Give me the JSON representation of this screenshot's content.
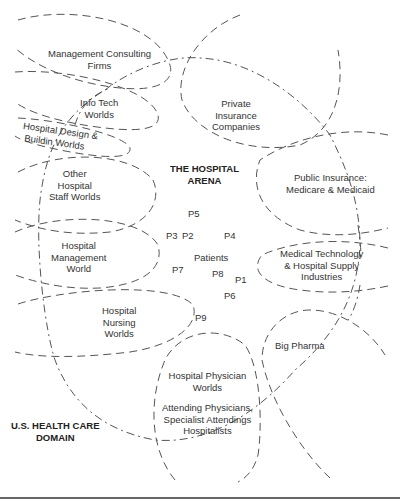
{
  "diagram": {
    "arena": {
      "title_line1": "THE HOSPITAL",
      "title_line2": "ARENA"
    },
    "domain": {
      "line1": "U.S. HEALTH CARE",
      "line2": "DOMAIN"
    },
    "worlds": {
      "management_consulting": {
        "line1": "Management Consulting",
        "line2": "Firms"
      },
      "info_tech": {
        "line1": "Info Tech",
        "line2": "Worlds"
      },
      "hospital_design": {
        "line1": "Hospital Design &",
        "line2": "Buildin Worlds"
      },
      "other_staff": {
        "line1": "Other",
        "line2": "Hospital",
        "line3": "Staff Worlds"
      },
      "management": {
        "line1": "Hospital",
        "line2": "Management",
        "line3": "World"
      },
      "nursing": {
        "line1": "Hospital",
        "line2": "Nursing",
        "line3": "Worlds"
      },
      "physician": {
        "line1": "Hospital Physician",
        "line2": "Worlds",
        "line3": "Attending Physicians,",
        "line4": "Specialist Attendings",
        "line5": "Hospitalists"
      },
      "private_insurance": {
        "line1": "Private",
        "line2": "Insurance",
        "line3": "Companies"
      },
      "public_insurance": {
        "line1": "Public Insurance:",
        "line2": "Medicare & Medicaid"
      },
      "med_tech": {
        "line1": "Medical Technology",
        "line2": "& Hospital Supply",
        "line3": "Industries"
      },
      "big_pharma": {
        "line1": "Big Pharma"
      }
    },
    "patients": {
      "label": "Patients",
      "points": [
        "P1",
        "P2",
        "P3",
        "P4",
        "P5",
        "P6",
        "P7",
        "P8",
        "P9"
      ]
    }
  }
}
